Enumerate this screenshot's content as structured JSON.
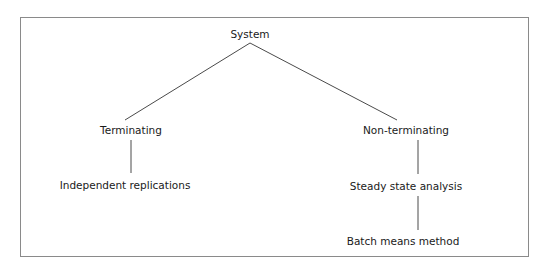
{
  "diagram": {
    "type": "tree",
    "frame": {
      "border_color": "#8a8a8a"
    },
    "line_color": "#4a4a4a",
    "text_color": "#1a1a1a",
    "nodes": {
      "root": {
        "label": "System"
      },
      "terminating": {
        "label": "Terminating"
      },
      "independent": {
        "label": "Independent replications"
      },
      "nonterminating": {
        "label": "Non-terminating"
      },
      "steady": {
        "label": "Steady state analysis"
      },
      "batch": {
        "label": "Batch means method"
      }
    },
    "edges": [
      {
        "from": "System",
        "to": "Terminating"
      },
      {
        "from": "System",
        "to": "Non-terminating"
      },
      {
        "from": "Terminating",
        "to": "Independent replications"
      },
      {
        "from": "Non-terminating",
        "to": "Steady state analysis"
      },
      {
        "from": "Steady state analysis",
        "to": "Batch means method"
      }
    ]
  }
}
